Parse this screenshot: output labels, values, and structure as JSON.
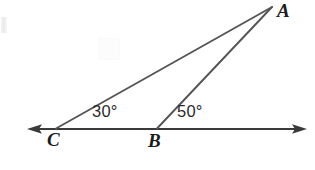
{
  "figure": {
    "kind": "geometry-diagram",
    "width": 315,
    "height": 170,
    "background_color": "#ffffff",
    "stroke_color": "#555555",
    "line_color": "#3a3a3a",
    "text_color": "#1c1c1c"
  },
  "points": {
    "A": {
      "label": "A",
      "x": 272,
      "y": 7
    },
    "B": {
      "label": "B",
      "x": 157,
      "y": 129
    },
    "C": {
      "label": "C",
      "x": 56,
      "y": 129
    }
  },
  "baseline": {
    "name": "horizontal-line-through-C-and-B",
    "y": 129,
    "x_start": 27,
    "x_end": 307,
    "arrow_left": true,
    "arrow_right": true
  },
  "segments": [
    {
      "name": "segment-CA",
      "from": "C",
      "to": "A"
    },
    {
      "name": "segment-BA",
      "from": "B",
      "to": "A"
    }
  ],
  "angles": [
    {
      "name": "angle-at-C",
      "vertex": "C",
      "value": 30,
      "label": "30°"
    },
    {
      "name": "angle-at-B",
      "vertex": "B",
      "value": 50,
      "label": "50°"
    }
  ]
}
